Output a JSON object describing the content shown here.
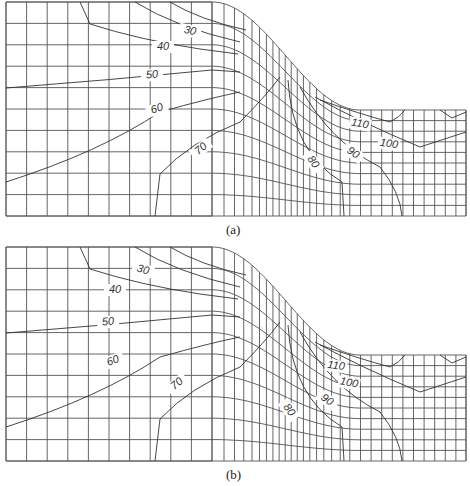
{
  "figure": {
    "panels": [
      {
        "id": "a",
        "caption": "(a)",
        "contour_labels": [
          {
            "text": "30",
            "x": 190,
            "y": 34,
            "rot": 12
          },
          {
            "text": "40",
            "x": 163,
            "y": 50,
            "rot": 0
          },
          {
            "text": "50",
            "x": 152,
            "y": 78,
            "rot": -5
          },
          {
            "text": "60",
            "x": 157,
            "y": 112,
            "rot": -18
          },
          {
            "text": "70",
            "x": 201,
            "y": 152,
            "rot": -40
          },
          {
            "text": "110",
            "x": 360,
            "y": 127,
            "rot": 10
          },
          {
            "text": "100",
            "x": 389,
            "y": 147,
            "rot": 8
          },
          {
            "text": "90",
            "x": 353,
            "y": 156,
            "rot": 35
          },
          {
            "text": "80",
            "x": 313,
            "y": 165,
            "rot": 55
          }
        ]
      },
      {
        "id": "b",
        "caption": "(b)",
        "contour_labels": [
          {
            "text": "30",
            "x": 143,
            "y": 273,
            "rot": 15
          },
          {
            "text": "40",
            "x": 115,
            "y": 293,
            "rot": 0
          },
          {
            "text": "50",
            "x": 108,
            "y": 325,
            "rot": -5
          },
          {
            "text": "60",
            "x": 113,
            "y": 364,
            "rot": -20
          },
          {
            "text": "70",
            "x": 177,
            "y": 387,
            "rot": -40
          },
          {
            "text": "110",
            "x": 336,
            "y": 369,
            "rot": 8
          },
          {
            "text": "100",
            "x": 349,
            "y": 386,
            "rot": 10
          },
          {
            "text": "90",
            "x": 327,
            "y": 403,
            "rot": 35
          },
          {
            "text": "80",
            "x": 289,
            "y": 413,
            "rot": 55
          }
        ]
      }
    ],
    "contour_values": [
      30,
      40,
      50,
      60,
      70,
      80,
      90,
      100,
      110
    ]
  }
}
